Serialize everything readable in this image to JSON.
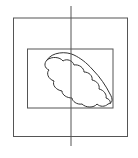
{
  "diagram": {
    "background": "#ffffff",
    "stroke_color": "#555555",
    "shapes": [
      {
        "type": "rect",
        "name": "outer-rectangle",
        "x": 13.5,
        "y": 18,
        "width": 114,
        "height": 118.5
      },
      {
        "type": "rect",
        "name": "inner-rectangle",
        "x": 27.5,
        "y": 49,
        "width": 85.5,
        "height": 59
      },
      {
        "type": "line",
        "name": "vertical-axis-line",
        "x1": 71,
        "y1": 6,
        "x2": 71,
        "y2": 146
      },
      {
        "type": "cloud",
        "name": "cloud-shape"
      }
    ]
  }
}
